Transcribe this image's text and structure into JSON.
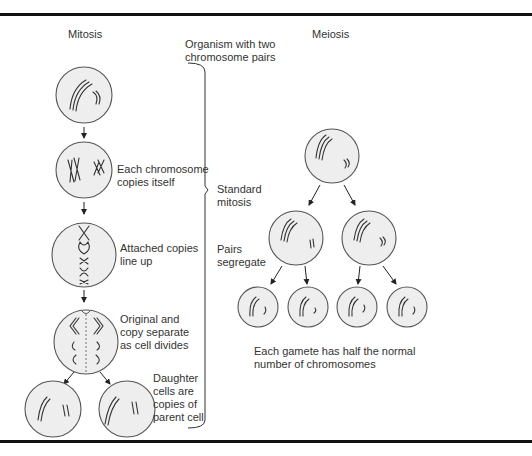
{
  "headers": {
    "mitosis": "Mitosis",
    "meiosis": "Meiosis",
    "organism": "Organism with two\nchromosome pairs"
  },
  "mitosis_steps": [
    {
      "label": ""
    },
    {
      "label": "Each chromosome\ncopies itself"
    },
    {
      "label": "Attached copies\nline up"
    },
    {
      "label": "Original and\ncopy separate\nas cell divides"
    },
    {
      "label": "Daughter\ncells are\ncopies of\nparent cell"
    }
  ],
  "meiosis_labels": {
    "standard_mitosis": "Standard\nmitosis",
    "pairs_segregate": "Pairs\nsegregate",
    "gamete_note": "Each gamete has half the normal\nnumber of chromosomes"
  },
  "colors": {
    "cell_fill": "#eeeeee",
    "cell_stroke": "#555555",
    "rule": "#111111",
    "text": "#333333"
  }
}
